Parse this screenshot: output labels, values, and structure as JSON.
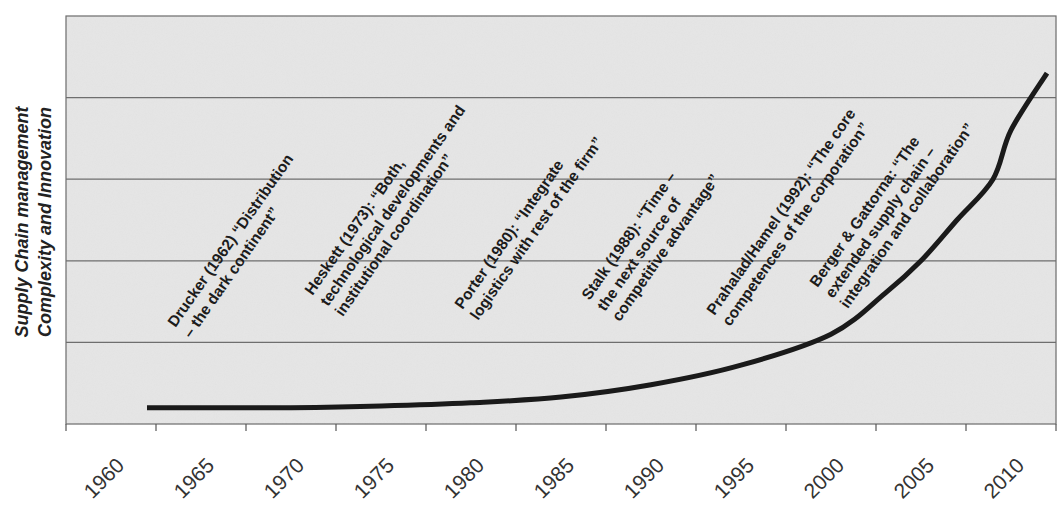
{
  "chart_data": {
    "type": "line",
    "title": "",
    "xlabel": "",
    "ylabel": "Supply Chain management Complexity and Innovation",
    "ylabel_lines": [
      "Supply Chain management",
      "Complexity and Innovation"
    ],
    "x_ticks": [
      "1960",
      "1965",
      "1970",
      "1975",
      "1980",
      "1985",
      "1990",
      "1995",
      "2000",
      "2005",
      "2010"
    ],
    "y_ticks": [],
    "ylim": [
      0,
      5
    ],
    "grid": {
      "horizontal": true,
      "vertical": false,
      "lines": 5
    },
    "legend": null,
    "series": [
      {
        "name": "Supply Chain management Complexity and Innovation",
        "x": [
          1962,
          1965,
          1970,
          1975,
          1980,
          1985,
          1990,
          1995,
          2000,
          2003,
          2005,
          2007,
          2009,
          2010,
          2012
        ],
        "values": [
          0.2,
          0.2,
          0.2,
          0.22,
          0.26,
          0.33,
          0.48,
          0.72,
          1.1,
          1.6,
          2.0,
          2.5,
          3.0,
          3.6,
          4.3
        ]
      }
    ],
    "annotations": [
      {
        "year": 1962,
        "lines": [
          "Drucker (1962) “Distribution",
          "– the dark continent”"
        ]
      },
      {
        "year": 1973,
        "lines": [
          "Heskett (1973): “Both,",
          "technological developments and",
          "institutional coordination”"
        ]
      },
      {
        "year": 1980,
        "lines": [
          "Porter (1980): “Integrate",
          "logistics with rest of the firm”"
        ]
      },
      {
        "year": 1988,
        "lines": [
          "Stalk (1988): “Time –",
          "the next source of",
          "competitive advantage”"
        ]
      },
      {
        "year": 1992,
        "lines": [
          "Prahalad/Hamel (1992): “The core",
          "competences of the corporation”"
        ]
      },
      {
        "year": null,
        "lines": [
          "Berger & Gattorna: “The",
          "extended supply chain –",
          "integration and collaboration”"
        ]
      }
    ]
  },
  "colors": {
    "plot_background": "#e6e6e6",
    "gridline": "#6e6e6e",
    "axis": "#555555",
    "curve": "#1a1a1a",
    "text": "#1c1c1c"
  }
}
